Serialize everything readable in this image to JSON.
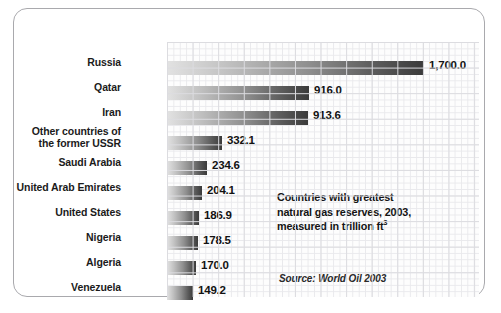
{
  "chart_data": {
    "type": "bar",
    "orientation": "horizontal",
    "title": "",
    "xlabel": "",
    "ylabel": "",
    "categories": [
      "Russia",
      "Qatar",
      "Iran",
      "Other countries of the former USSR",
      "Saudi Arabia",
      "United Arab Emirates",
      "United States",
      "Nigeria",
      "Algeria",
      "Venezuela"
    ],
    "values": [
      1700.0,
      916.0,
      913.6,
      332.1,
      234.6,
      204.1,
      186.9,
      178.5,
      170.0,
      149.2
    ],
    "value_labels": [
      "1,700.0",
      "916.0",
      "913.6",
      "332.1",
      "234.6",
      "204.1",
      "186.9",
      "178.5",
      "170.0",
      "149.2"
    ],
    "xlim": [
      0,
      1700
    ],
    "grid": true,
    "legend": "none",
    "units": "trillion cubic feet",
    "annotation": {
      "line1": "Countries with greatest",
      "line2": "natural gas reserves, 2003,",
      "line3_prefix": "measured in trillion ft",
      "line3_superscript": "3"
    },
    "source": "Source: World Oil 2003",
    "colors": {
      "bar_gradient_start": "#e2e2e2",
      "bar_gradient_end": "#3a3a3a",
      "grid_minor": "#e9e9ec",
      "grid_major": "#dcdce0",
      "text": "#141414",
      "frame_border": "#a9a9ad",
      "background": "#ffffff"
    }
  },
  "rows": [
    {
      "label_line1": "Russia",
      "label_line2": "",
      "value": "1,700.0",
      "bar_px": 257,
      "y": 15
    },
    {
      "label_line1": "Qatar",
      "label_line2": "",
      "value": "916.0",
      "bar_px": 142,
      "y": 40
    },
    {
      "label_line1": "Iran",
      "label_line2": "",
      "value": "913.6",
      "bar_px": 141,
      "y": 65
    },
    {
      "label_line1": "Other countries of",
      "label_line2": "the former USSR",
      "value": "332.1",
      "bar_px": 55,
      "y": 90
    },
    {
      "label_line1": "Saudi Arabia",
      "label_line2": "",
      "value": "234.6",
      "bar_px": 40,
      "y": 115
    },
    {
      "label_line1": "United Arab Emirates",
      "label_line2": "",
      "value": "204.1",
      "bar_px": 35,
      "y": 140
    },
    {
      "label_line1": "United States",
      "label_line2": "",
      "value": "186.9",
      "bar_px": 32,
      "y": 165
    },
    {
      "label_line1": "Nigeria",
      "label_line2": "",
      "value": "178.5",
      "bar_px": 31,
      "y": 190
    },
    {
      "label_line1": "Algeria",
      "label_line2": "",
      "value": "170.0",
      "bar_px": 29,
      "y": 215
    },
    {
      "label_line1": "Venezuela",
      "label_line2": "",
      "value": "149.2",
      "bar_px": 26,
      "y": 240
    }
  ]
}
